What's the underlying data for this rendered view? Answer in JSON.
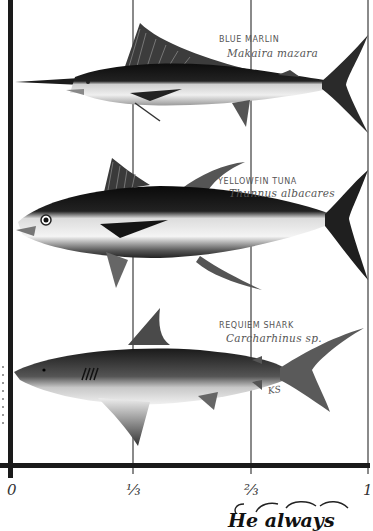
{
  "figure": {
    "axis": {
      "ticks": [
        {
          "label": "0",
          "position": 0
        },
        {
          "label": "⅓",
          "position": 0.333
        },
        {
          "label": "⅔",
          "position": 0.667
        },
        {
          "label": "1",
          "position": 1
        }
      ]
    },
    "fish": [
      {
        "id": "blue-marlin",
        "common_name": "BLUE MARLIN",
        "scientific_name": "Makaira mazara"
      },
      {
        "id": "yellowfin-tuna",
        "common_name": "YELLOWFIN TUNA",
        "scientific_name": "Thunnus albacares"
      },
      {
        "id": "requiem-shark",
        "common_name": "REQUIEM SHARK",
        "scientific_name": "Carcharhinus sp."
      }
    ],
    "signature": "KS",
    "caption_fragment": "He always"
  },
  "colors": {
    "axis": "#1a1a1a",
    "grid": "#8a8a8a",
    "label_text": "#555555",
    "background": "#ffffff"
  }
}
